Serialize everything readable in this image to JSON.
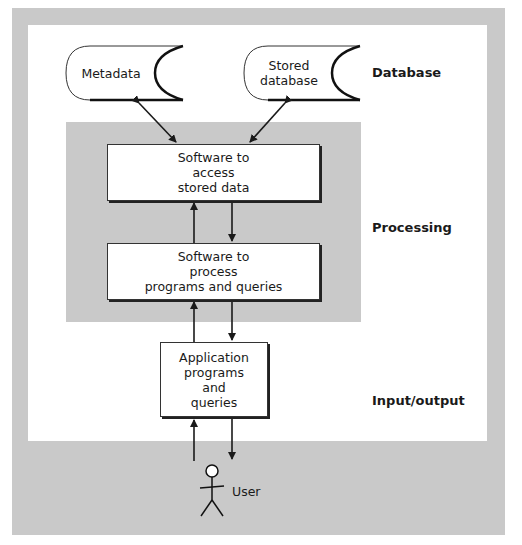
{
  "diagram": {
    "tiers": {
      "database": "Database",
      "processing": "Processing",
      "io": "Input/output"
    },
    "stores": [
      {
        "label": "Metadata"
      },
      {
        "label": "Stored\ndatabase"
      }
    ],
    "boxes": {
      "access": "Software to\naccess\nstored data",
      "process": "Software to\nprocess\nprograms and queries",
      "application": "Application\nprograms\nand\nqueries"
    },
    "actor": {
      "label": "User"
    },
    "colors": {
      "frame": "#c9c9c9",
      "panel": "#ffffff",
      "line": "#1a1a1a"
    }
  }
}
